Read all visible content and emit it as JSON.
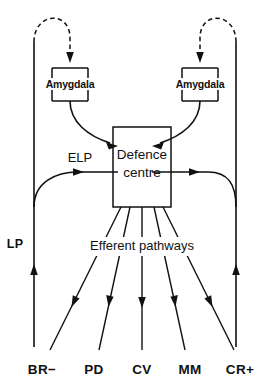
{
  "diagram": {
    "colors": {
      "ink": "#111111",
      "background": "#ffffff"
    },
    "nodes": {
      "amygdala_left": {
        "label": "Amygdala"
      },
      "amygdala_right": {
        "label": "Amygdala"
      },
      "defence_centre": {
        "label_line1": "Defence",
        "label_line2": "centre"
      }
    },
    "labels": {
      "elp": "ELP",
      "lp": "LP",
      "efferent_pathways": "Efferent pathways"
    },
    "outputs": [
      {
        "code": "BR−"
      },
      {
        "code": "PD"
      },
      {
        "code": "CV"
      },
      {
        "code": "MM"
      },
      {
        "code": "CR+"
      }
    ]
  }
}
